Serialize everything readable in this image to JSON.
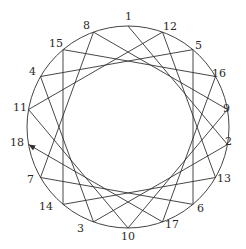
{
  "diagram": {
    "type": "star-polygon-path",
    "circle": {
      "cx": 128,
      "cy": 127,
      "r": 101
    },
    "points_clockwise_from_top": [
      "1",
      "12",
      "5",
      "16",
      "9",
      "2",
      "13",
      "6",
      "17",
      "10",
      "3",
      "14",
      "7",
      "18",
      "11",
      "4",
      "15",
      "8"
    ],
    "path_order": [
      "1",
      "2",
      "3",
      "4",
      "5",
      "6",
      "7",
      "8",
      "9",
      "10",
      "11",
      "12",
      "13",
      "14",
      "15",
      "16",
      "17",
      "18"
    ],
    "arrow_at": "18",
    "stroke_color": "#333333"
  },
  "labels": {
    "p0": "1",
    "p1": "12",
    "p2": "5",
    "p3": "16",
    "p4": "9",
    "p5": "2",
    "p6": "13",
    "p7": "6",
    "p8": "17",
    "p9": "10",
    "p10": "3",
    "p11": "14",
    "p12": "7",
    "p13": "18",
    "p14": "11",
    "p15": "4",
    "p16": "15",
    "p17": "8"
  }
}
